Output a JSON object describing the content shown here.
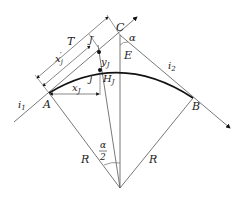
{
  "diagram": {
    "labels": {
      "T": "T",
      "xj_prime": "x",
      "xj_prime_sub": "j",
      "xj_prime_mark": "′",
      "J_prime": "J",
      "J_prime_mark": "′",
      "J": "J",
      "yj": "y",
      "yj_sub": "J",
      "Hj": "H",
      "Hj_sub": "J",
      "xj": "x",
      "xj_sub": "J",
      "C": "C",
      "E": "E",
      "alpha": "α",
      "i1": "i",
      "i1_sub": "1",
      "i2": "i",
      "i2_sub": "2",
      "A": "A",
      "B": "B",
      "R_left": "R",
      "R_right": "R",
      "half_alpha_num": "α",
      "half_alpha_den": "2"
    },
    "colors": {
      "line": "#555555",
      "curve": "#111111",
      "text": "#222222"
    }
  }
}
